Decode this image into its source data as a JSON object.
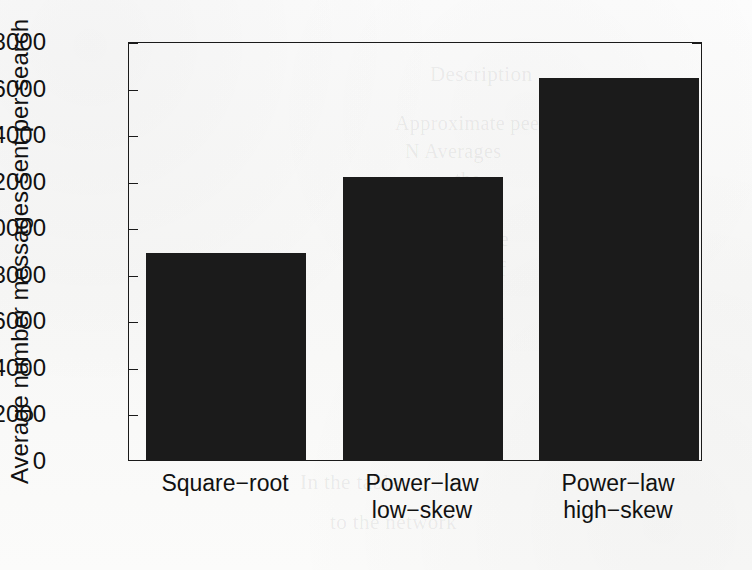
{
  "chart_data": {
    "type": "bar",
    "title": "",
    "xlabel": "",
    "ylabel": "Average number messages sent per search",
    "categories": [
      "Square−root",
      "Power−law low−skew",
      "Power−law high−skew"
    ],
    "category_lines": [
      [
        "Square−root"
      ],
      [
        "Power−law",
        "low−skew"
      ],
      [
        "Power−law",
        "high−skew"
      ]
    ],
    "values": [
      8900,
      12150,
      16400
    ],
    "ylim": [
      0,
      18000
    ],
    "yticks": [
      0,
      2000,
      4000,
      6000,
      8000,
      10000,
      12000,
      14000,
      16000,
      18000
    ],
    "ytick_labels": [
      "0",
      "2000",
      "4000",
      "6000",
      "8000",
      "10000",
      "12000",
      "14000",
      "16000",
      "18000"
    ],
    "grid": false,
    "legend": false,
    "bar_color": "#1b1b1b",
    "axis_color": "#1a1a1a",
    "background_color": "#ffffff"
  },
  "figure": {
    "y_axis_title": "Average number messages sent per search"
  },
  "background_artifacts": {
    "description": "faint bleed-through text from the reverse of the scanned page",
    "lines": [
      "Description",
      "Approximate peer",
      "N Averages",
      "the",
      "of the",
      "Average",
      "number of",
      "Comparison",
      "distribution",
      "search is",
      "message",
      "In the table",
      "to the network"
    ]
  }
}
